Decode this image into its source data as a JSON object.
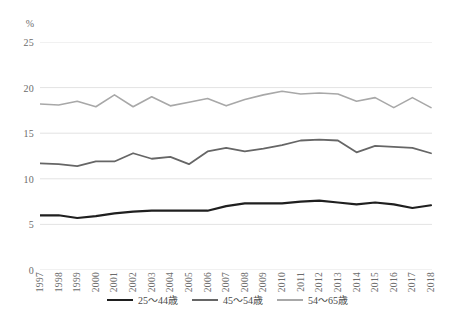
{
  "chart_data": {
    "type": "line",
    "title": "",
    "subtitle": "",
    "xlabel": "",
    "ylabel": "%",
    "unit_label": "%",
    "ylim": [
      0,
      25
    ],
    "yticks": [
      25,
      20,
      15,
      10,
      5,
      0
    ],
    "grid": true,
    "legend_position": "bottom",
    "x": [
      "1997",
      "1998",
      "1999",
      "2000",
      "2001",
      "2002",
      "2003",
      "2004",
      "2005",
      "2006",
      "2007",
      "2008",
      "2009",
      "2010",
      "2011",
      "2012",
      "2013",
      "2014",
      "2015",
      "2016",
      "2017",
      "2018"
    ],
    "series": [
      {
        "name": "25～44歳",
        "color": "#1f1f1f",
        "width": 2.2,
        "values": [
          6.0,
          6.0,
          5.7,
          5.9,
          6.2,
          6.4,
          6.5,
          6.5,
          6.5,
          6.5,
          7.0,
          7.3,
          7.3,
          7.3,
          7.5,
          7.6,
          7.4,
          7.2,
          7.4,
          7.2,
          6.8,
          7.1
        ]
      },
      {
        "name": "45～54歳",
        "color": "#666666",
        "width": 1.8,
        "values": [
          11.7,
          11.6,
          11.4,
          11.9,
          11.9,
          12.8,
          12.2,
          12.4,
          11.6,
          13.0,
          13.4,
          13.0,
          13.3,
          13.7,
          14.2,
          14.3,
          14.2,
          12.9,
          13.6,
          13.5,
          13.4,
          12.8
        ]
      },
      {
        "name": "54～65歳",
        "color": "#a8a8a8",
        "width": 1.6,
        "values": [
          18.2,
          18.1,
          18.5,
          17.9,
          19.2,
          17.9,
          19.0,
          18.0,
          18.4,
          18.8,
          18.0,
          18.7,
          19.2,
          19.6,
          19.3,
          19.4,
          19.3,
          18.5,
          18.9,
          17.8,
          18.9,
          17.8
        ]
      }
    ],
    "grid_color": "#e3e3e3",
    "axis_text_color": "#6b6b6b",
    "background": "#ffffff"
  }
}
